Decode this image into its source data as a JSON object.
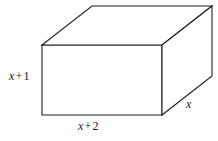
{
  "figure": {
    "type": "rectangular-prism-diagram",
    "background_color": "#ffffff",
    "line_color": "#231f20",
    "line_width": 1,
    "labels": {
      "height": {
        "var": "x",
        "op": "+",
        "num": "1",
        "text": "x + 1",
        "edge": "left-vertical-front"
      },
      "width": {
        "var": "x",
        "op": "+",
        "num": "2",
        "text": "x + 2",
        "edge": "bottom-horizontal-front"
      },
      "depth": {
        "var": "x",
        "op": "",
        "num": "",
        "text": "x",
        "edge": "right-slant-depth"
      }
    },
    "geometry": {
      "front_face": [
        [
          42,
          45
        ],
        [
          162,
          45
        ],
        [
          162,
          115
        ],
        [
          42,
          115
        ]
      ],
      "back_offset": [
        50,
        -39
      ],
      "back_face": [
        [
          92,
          6
        ],
        [
          212,
          6
        ],
        [
          212,
          76
        ],
        [
          92,
          76
        ]
      ],
      "visible_faces": [
        "front",
        "top",
        "right"
      ]
    }
  }
}
